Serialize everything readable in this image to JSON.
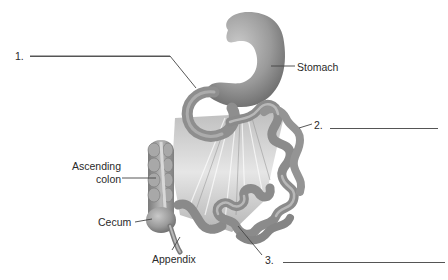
{
  "figure": {
    "labels": {
      "stomach": "Stomach",
      "ascending_colon_line1": "Ascending",
      "ascending_colon_line2": "colon",
      "cecum": "Cecum",
      "appendix": "Appendix"
    },
    "blanks": [
      {
        "number": "1.",
        "answer": ""
      },
      {
        "number": "2.",
        "answer": ""
      },
      {
        "number": "3.",
        "answer": ""
      }
    ],
    "colors": {
      "background": "#ffffff",
      "organ_fill": "#9a9a9a",
      "organ_shadow": "#6f6f6f",
      "organ_highlight": "#c8c8c8",
      "mesentery": "#d9d9d9",
      "leader_line": "#444444",
      "text": "#2a2a2a"
    }
  }
}
